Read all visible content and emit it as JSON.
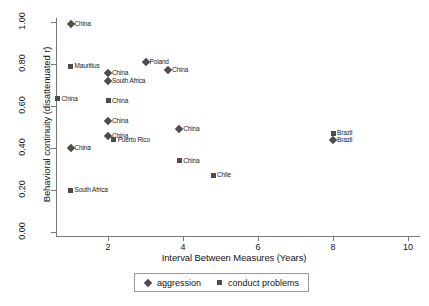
{
  "chart_data": {
    "type": "scatter",
    "title": "",
    "xlabel": "Interval Between Measures (Years)",
    "ylabel": "Behavioral continuity (disattenuated r)",
    "xlim": [
      0.4,
      10.4
    ],
    "ylim": [
      0.0,
      1.04
    ],
    "xticks": [
      2,
      4,
      6,
      8,
      10
    ],
    "xticklabels": [
      "2",
      "4",
      "6",
      "8",
      "10"
    ],
    "yticks": [
      0.0,
      0.2,
      0.4,
      0.6,
      0.8,
      1.0
    ],
    "yticklabels": [
      "0.00",
      "0.20",
      "0.40",
      "0.60",
      "0.80",
      "1.00"
    ],
    "grid": false,
    "legend_position": "bottom-center",
    "marker_color": "#4d4d4d",
    "series": [
      {
        "name": "aggression",
        "marker": "diamond",
        "points": [
          {
            "label": "China",
            "x": 1.0,
            "y": 0.99,
            "label_side": "right"
          },
          {
            "label": "China",
            "x": 2.0,
            "y": 0.755,
            "label_side": "right"
          },
          {
            "label": "South Africa",
            "x": 2.0,
            "y": 0.72,
            "label_side": "right"
          },
          {
            "label": "Poland",
            "x": 3.0,
            "y": 0.81,
            "label_side": "right"
          },
          {
            "label": "China",
            "x": 3.6,
            "y": 0.77,
            "label_side": "right"
          },
          {
            "label": "China",
            "x": 2.0,
            "y": 0.53,
            "label_side": "right"
          },
          {
            "label": "China",
            "x": 2.0,
            "y": 0.455,
            "label_side": "right"
          },
          {
            "label": "China",
            "x": 1.0,
            "y": 0.4,
            "label_side": "right"
          },
          {
            "label": "China",
            "x": 3.9,
            "y": 0.49,
            "label_side": "right"
          },
          {
            "label": "Brazil",
            "x": 8.0,
            "y": 0.44,
            "label_side": "right"
          }
        ]
      },
      {
        "name": "conduct problems",
        "marker": "square",
        "points": [
          {
            "label": "Mauritius",
            "x": 1.0,
            "y": 0.79,
            "label_side": "right"
          },
          {
            "label": "China",
            "x": 0.65,
            "y": 0.635,
            "label_side": "right"
          },
          {
            "label": "China",
            "x": 2.0,
            "y": 0.625,
            "label_side": "right"
          },
          {
            "label": "Puerto Rico",
            "x": 2.15,
            "y": 0.44,
            "label_side": "right"
          },
          {
            "label": "South Africa",
            "x": 1.0,
            "y": 0.2,
            "label_side": "right"
          },
          {
            "label": "China",
            "x": 3.9,
            "y": 0.34,
            "label_side": "right"
          },
          {
            "label": "Chile",
            "x": 4.8,
            "y": 0.27,
            "label_side": "right"
          },
          {
            "label": "Brazil",
            "x": 8.0,
            "y": 0.47,
            "label_side": "right"
          }
        ]
      }
    ]
  },
  "legend": {
    "entries": [
      {
        "label": "aggression",
        "marker": "diamond"
      },
      {
        "label": "conduct problems",
        "marker": "square"
      }
    ]
  }
}
